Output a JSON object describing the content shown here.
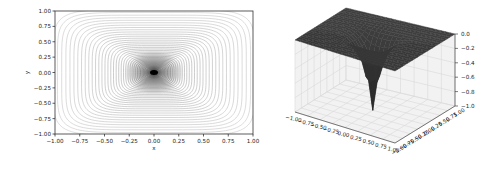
{
  "figure": {
    "width": 502,
    "height": 170,
    "background": "#ffffff"
  },
  "chart_data": [
    {
      "type": "contour",
      "title": "",
      "xlabel": "x",
      "ylabel": "y",
      "xlim": [
        -1.0,
        1.0
      ],
      "ylim": [
        -1.0,
        1.0
      ],
      "xticks": [
        "-1.00",
        "-0.75",
        "-0.50",
        "-0.25",
        "0.00",
        "0.25",
        "0.50",
        "0.75",
        "1.00"
      ],
      "yticks": [
        "1.00",
        "0.75",
        "0.50",
        "0.25",
        "0.00",
        "-0.25",
        "-0.50",
        "-0.75",
        "-1.00"
      ],
      "grid": false,
      "legend": null,
      "colormap": "grey",
      "line_color": "#808080",
      "levels": 50,
      "function_description": "z = -(1 - (|x|^p + |y|^p)^(1/p))^k style cusp; minimum -1 at (0,0), approaching 0 at the edges of the square",
      "min_point": {
        "x": 0.0,
        "y": 0.0,
        "z": -1.0
      }
    },
    {
      "type": "surface3d",
      "title": "",
      "xlabel": "",
      "ylabel": "",
      "zlabel": "",
      "xlim": [
        -1.0,
        1.0
      ],
      "ylim": [
        -1.0,
        1.0
      ],
      "zlim": [
        -1.0,
        0.0
      ],
      "xticks": [
        "-1.00",
        "-0.75",
        "-0.50",
        "-0.25",
        "0.00",
        "0.25",
        "0.50",
        "0.75",
        "1.00"
      ],
      "yticks": [
        "-1.00",
        "-0.75",
        "-0.50",
        "-0.25",
        "0.00",
        "0.25",
        "0.50",
        "0.75",
        "1.00"
      ],
      "zticks": [
        "0.0",
        "-0.2",
        "-0.4",
        "-0.6",
        "-0.8",
        "-1.0"
      ],
      "grid": true,
      "surface_color": "#2b2b2b",
      "pane_color": "#f2f2f2",
      "grid_color": "#d9d9d9",
      "min_point": {
        "x": 0.0,
        "y": 0.0,
        "z": -1.0
      },
      "edge_value": 0.0
    }
  ]
}
